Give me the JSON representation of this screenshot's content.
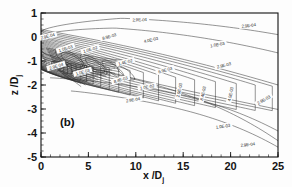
{
  "figure": {
    "panel_label": "(b)",
    "background": "#ffffff",
    "line_color": "#2b2b2b"
  },
  "chart_data": {
    "type": "line",
    "subtype": "contour",
    "title": "",
    "xlabel": "x /D",
    "xlabel_sub": "j",
    "ylabel": "z /D",
    "ylabel_sub": "j",
    "xlim": [
      0,
      25
    ],
    "ylim": [
      -5,
      1
    ],
    "xticks": [
      0,
      5,
      10,
      15,
      20,
      25
    ],
    "xticklabels": [
      "0",
      "5",
      "10",
      "15",
      "20",
      "25"
    ],
    "yticks": [
      -5,
      -4,
      -3,
      -2,
      -1,
      0,
      1
    ],
    "yticklabels": [
      "-5",
      "-4",
      "-3",
      "-2",
      "-1",
      "0",
      "1"
    ],
    "x_minor_tick_step": 1,
    "y_minor_tick_step": 0.25,
    "grid": false,
    "legend": "none",
    "annotations": [
      "(b)"
    ],
    "contour_levels": [
      "2.9E-04",
      "1.0E-03",
      "2.9E-03",
      "4.0E-03",
      "6.9E-03",
      "8.4E-03",
      "8.9E-03",
      "1.0E-02",
      "1.4E-02"
    ],
    "inline_labels": [
      {
        "text": "2.9E-04",
        "x": 10.4,
        "y": 0.72,
        "rot": -2
      },
      {
        "text": "2.9E-04",
        "x": 21.9,
        "y": 0.48,
        "rot": -7
      },
      {
        "text": "2.9E-04",
        "x": 0.7,
        "y": 0.03,
        "rot": -14
      },
      {
        "text": "1.0E-03",
        "x": 18.6,
        "y": -0.32,
        "rot": -11
      },
      {
        "text": "8.9E-03",
        "x": 7.2,
        "y": 0.02,
        "rot": -16
      },
      {
        "text": "4.0E-03",
        "x": 11.6,
        "y": -0.12,
        "rot": -13
      },
      {
        "text": "1.0E-03",
        "x": 2.6,
        "y": -0.48,
        "rot": -18
      },
      {
        "text": "1.0E-02",
        "x": 5.2,
        "y": -0.52,
        "rot": -17
      },
      {
        "text": "2.9E-03",
        "x": 19.3,
        "y": -1.18,
        "rot": -14
      },
      {
        "text": "1.4E-02",
        "x": 8.9,
        "y": -1.05,
        "rot": -14
      },
      {
        "text": "6.9E-03",
        "x": 13.1,
        "y": -1.38,
        "rot": -16
      },
      {
        "text": "2.9E-04",
        "x": 1.6,
        "y": -1.22,
        "rot": -16
      },
      {
        "text": "1.0E-03",
        "x": 4.4,
        "y": -1.46,
        "rot": -16
      },
      {
        "text": "8.4E-03",
        "x": 8.4,
        "y": -1.78,
        "rot": -16
      },
      {
        "text": "1.0E-02",
        "x": 11.2,
        "y": -2.08,
        "rot": -10
      },
      {
        "text": "2.9E-03",
        "x": 14.6,
        "y": -2.22,
        "rot": -78
      },
      {
        "text": "8.4E-03",
        "x": 17.1,
        "y": -2.35,
        "rot": -78
      },
      {
        "text": "4.0E-03",
        "x": 20.0,
        "y": -2.38,
        "rot": -78
      },
      {
        "text": "2.9E-03",
        "x": 23.5,
        "y": -2.62,
        "rot": -30
      },
      {
        "text": "2.9E-04",
        "x": 9.7,
        "y": -2.62,
        "rot": -10
      },
      {
        "text": "1.0E-03",
        "x": 19.2,
        "y": -3.72,
        "rot": -8
      },
      {
        "text": "2.9E-04",
        "x": 21.8,
        "y": -4.48,
        "rot": -6
      }
    ]
  }
}
